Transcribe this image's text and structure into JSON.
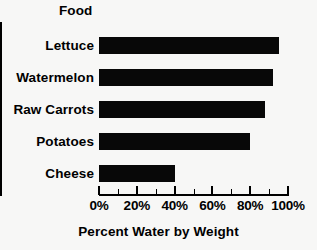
{
  "chart_data": {
    "type": "bar",
    "orientation": "horizontal",
    "title": "",
    "xlabel": "Percent Water by Weight",
    "ylabel": "Food",
    "categories": [
      "Lettuce",
      "Watermelon",
      "Raw Carrots",
      "Potatoes",
      "Cheese"
    ],
    "values": [
      95,
      92,
      88,
      80,
      40
    ],
    "xlim": [
      0,
      100
    ],
    "xticks": [
      0,
      20,
      40,
      60,
      80,
      100
    ],
    "xticklabels": [
      "0%",
      "20%",
      "40%",
      "60%",
      "80%",
      "100%"
    ],
    "minor_xticks": [
      10,
      30,
      50,
      70,
      90
    ],
    "grid": false,
    "legend": null,
    "bar_color": "#080808",
    "background_color": "#f7f7f6",
    "axis_color": "#000000"
  },
  "axes": {
    "category_axis_title": "Food",
    "value_axis_title": "Percent Water by Weight"
  },
  "bars": [
    {
      "label": "Lettuce",
      "value": 95
    },
    {
      "label": "Watermelon",
      "value": 92
    },
    {
      "label": "Raw Carrots",
      "value": 88
    },
    {
      "label": "Potatoes",
      "value": 80
    },
    {
      "label": "Cheese",
      "value": 40
    }
  ],
  "ticks": [
    {
      "value": 0,
      "label": "0%"
    },
    {
      "value": 20,
      "label": "20%"
    },
    {
      "value": 40,
      "label": "40%"
    },
    {
      "value": 60,
      "label": "60%"
    },
    {
      "value": 80,
      "label": "80%"
    },
    {
      "value": 100,
      "label": "100%"
    }
  ]
}
